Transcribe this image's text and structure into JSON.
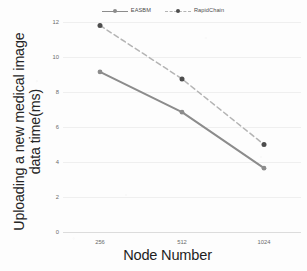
{
  "chart_data": {
    "type": "line",
    "title": "",
    "xlabel": "Node Number",
    "ylabel_lines": [
      "Uploading a new medical image",
      "data time(ms)"
    ],
    "ylabel": "Uploading a new medical image data time(ms)",
    "categories": [
      "256",
      "512",
      "1024"
    ],
    "ylim": [
      0,
      12
    ],
    "yticks": [
      "0",
      "2",
      "4",
      "6",
      "8",
      "10",
      "12"
    ],
    "ytick_values": [
      0,
      2,
      4,
      6,
      8,
      10,
      12
    ],
    "grid": "horizontal",
    "legend_position": "top",
    "series": [
      {
        "name": "EASBM",
        "values": [
          9.15,
          6.85,
          3.65
        ],
        "color": "#8c8c8c",
        "style": "solid",
        "marker": "circle"
      },
      {
        "name": "RapidChain",
        "values": [
          11.8,
          8.75,
          5.0
        ],
        "color": "#b4b4b4",
        "style": "dashed",
        "marker": "circle",
        "marker_color": "#4d4d4d"
      }
    ]
  }
}
